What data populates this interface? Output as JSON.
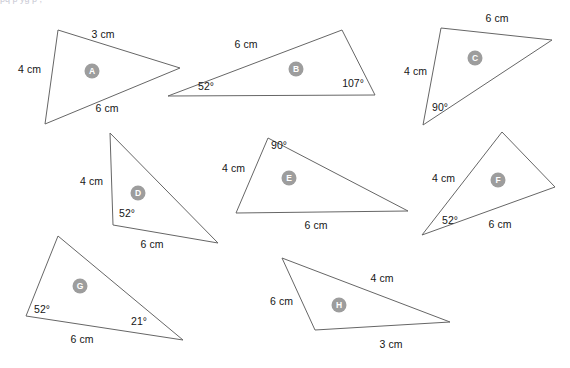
{
  "page": {
    "cropped_header_text": "pq p yg p ,",
    "background_color": "#ffffff",
    "stroke_color": "#666666",
    "label_text_color": "#161616",
    "badge_color": "#9d9d9d",
    "badge_text_color": "#ffffff"
  },
  "triangles": [
    {
      "id": "A",
      "label": "A",
      "points": "58,30 180,68 45,124",
      "badge": {
        "cx": 92,
        "cy": 71,
        "r": 7.5
      },
      "labels": [
        {
          "name": "side-top",
          "text": "3 cm",
          "x": 103,
          "y": 38,
          "anchor": "middle"
        },
        {
          "name": "side-left",
          "text": "4 cm",
          "x": 18,
          "y": 73,
          "anchor": "start"
        },
        {
          "name": "side-bottom",
          "text": "6 cm",
          "x": 107,
          "y": 112,
          "anchor": "middle"
        }
      ]
    },
    {
      "id": "B",
      "label": "B",
      "points": "342,30 168,96 375,95",
      "badge": {
        "cx": 296,
        "cy": 69,
        "r": 7.5
      },
      "labels": [
        {
          "name": "side-top",
          "text": "6 cm",
          "x": 246,
          "y": 48,
          "anchor": "middle"
        },
        {
          "name": "angle-left",
          "text": "52°",
          "x": 206,
          "y": 90,
          "anchor": "middle"
        },
        {
          "name": "angle-right",
          "text": "107°",
          "x": 353,
          "y": 87,
          "anchor": "middle"
        }
      ]
    },
    {
      "id": "C",
      "label": "C",
      "points": "441,28 552,40 423,125",
      "badge": {
        "cx": 475,
        "cy": 58,
        "r": 7.5
      },
      "labels": [
        {
          "name": "side-top",
          "text": "6 cm",
          "x": 497,
          "y": 22,
          "anchor": "middle"
        },
        {
          "name": "side-left",
          "text": "4 cm",
          "x": 404,
          "y": 75,
          "anchor": "start"
        },
        {
          "name": "angle-bottom",
          "text": "90°",
          "x": 440,
          "y": 111,
          "anchor": "middle"
        }
      ]
    },
    {
      "id": "D",
      "label": "D",
      "points": "110,133 218,243 113,225",
      "badge": {
        "cx": 138,
        "cy": 193,
        "r": 7.5
      },
      "labels": [
        {
          "name": "side-left",
          "text": "4 cm",
          "x": 80,
          "y": 185,
          "anchor": "start"
        },
        {
          "name": "angle-bottom-left",
          "text": "52°",
          "x": 127,
          "y": 217,
          "anchor": "middle"
        },
        {
          "name": "side-bottom",
          "text": "6 cm",
          "x": 152,
          "y": 248,
          "anchor": "middle"
        }
      ]
    },
    {
      "id": "E",
      "label": "E",
      "points": "268,138 408,211 236,213",
      "badge": {
        "cx": 289,
        "cy": 178,
        "r": 7.5
      },
      "labels": [
        {
          "name": "angle-top",
          "text": "90°",
          "x": 279,
          "y": 149,
          "anchor": "middle"
        },
        {
          "name": "side-left",
          "text": "4 cm",
          "x": 222,
          "y": 172,
          "anchor": "start"
        },
        {
          "name": "side-bottom",
          "text": "6 cm",
          "x": 316,
          "y": 229,
          "anchor": "middle"
        }
      ]
    },
    {
      "id": "F",
      "label": "F",
      "points": "502,132 555,187 422,235",
      "badge": {
        "cx": 498,
        "cy": 180,
        "r": 7.5
      },
      "labels": [
        {
          "name": "side-left",
          "text": "4 cm",
          "x": 432,
          "y": 182,
          "anchor": "start"
        },
        {
          "name": "angle-bottom-left",
          "text": "52°",
          "x": 450,
          "y": 224,
          "anchor": "middle"
        },
        {
          "name": "side-bottom",
          "text": "6 cm",
          "x": 500,
          "y": 228,
          "anchor": "middle"
        }
      ]
    },
    {
      "id": "G",
      "label": "G",
      "points": "58,236 183,340 26,316",
      "badge": {
        "cx": 80,
        "cy": 286,
        "r": 7.5
      },
      "labels": [
        {
          "name": "angle-left",
          "text": "52°",
          "x": 42,
          "y": 313,
          "anchor": "middle"
        },
        {
          "name": "angle-right",
          "text": "21°",
          "x": 139,
          "y": 325,
          "anchor": "middle"
        },
        {
          "name": "side-bottom",
          "text": "6 cm",
          "x": 82,
          "y": 343,
          "anchor": "middle"
        }
      ]
    },
    {
      "id": "H",
      "label": "H",
      "points": "282,258 450,322 315,330",
      "badge": {
        "cx": 339,
        "cy": 305,
        "r": 7.5
      },
      "labels": [
        {
          "name": "side-top",
          "text": "4 cm",
          "x": 382,
          "y": 282,
          "anchor": "middle"
        },
        {
          "name": "side-left",
          "text": "6 cm",
          "x": 270,
          "y": 305,
          "anchor": "start"
        },
        {
          "name": "side-bottom",
          "text": "3 cm",
          "x": 391,
          "y": 348,
          "anchor": "middle"
        }
      ]
    }
  ]
}
